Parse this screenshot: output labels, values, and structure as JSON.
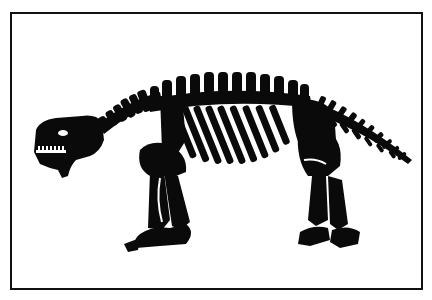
{
  "illustration": {
    "subject": "dinosaur-skeleton-silhouette",
    "colors": {
      "ink": "#0a0a0a",
      "paper": "#ffffff",
      "border": "#111111"
    }
  }
}
